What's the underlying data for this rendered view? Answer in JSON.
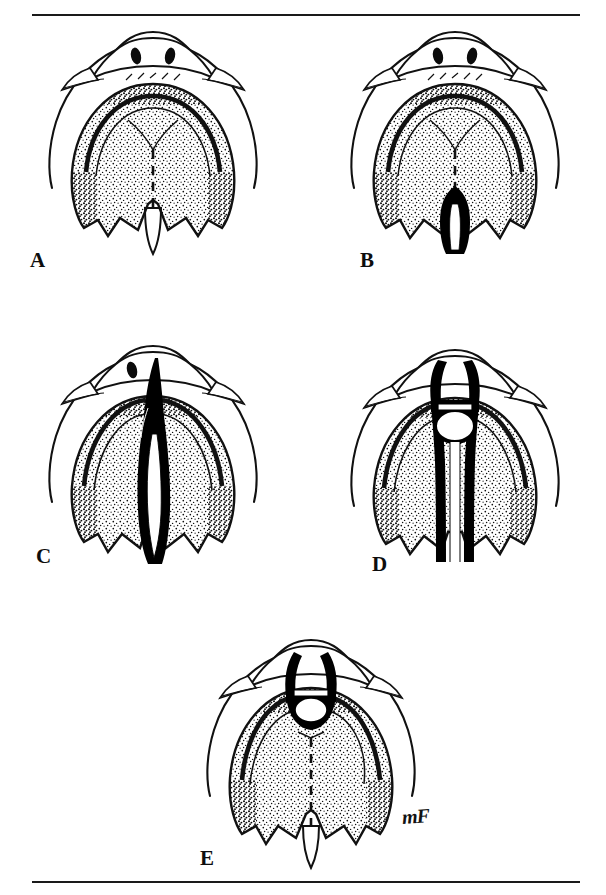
{
  "figure": {
    "medium": "pen-and-ink stipple anatomical illustration",
    "background_color": "#ffffff",
    "ink_color": "#000000",
    "rule_color": "#1a1a1a",
    "orientation": "inferior (palatal) view of the oral cavity, anterior at top",
    "signature": "mF"
  },
  "rules": {
    "top_label": "top-divider-rule",
    "bottom_label": "bottom-divider-rule"
  },
  "panels": [
    {
      "id": "A",
      "label": "A",
      "caption": "Normal palate",
      "description": "Intact hard and soft palate with midline palatine raphe shown as a dashed line and a single intact uvula.",
      "cleft_present": false,
      "cleft_extent": "none",
      "uvula": "single intact",
      "raphe_style": "dashed midline"
    },
    {
      "id": "B",
      "label": "B",
      "caption": "Cleft of the soft palate and uvula",
      "description": "Posterior cleft limited to the velum; bifid uvula with a narrow dark cleft opening, hard palate intact.",
      "cleft_present": true,
      "cleft_extent": "soft palate only",
      "uvula": "bifid",
      "raphe_style": "dashed midline anterior to cleft"
    },
    {
      "id": "C",
      "label": "C",
      "caption": "Cleft of the secondary palate",
      "description": "Cleft extends from the uvula forward through the soft and hard palate to the incisive foramen, sparing the alveolus.",
      "cleft_present": true,
      "cleft_extent": "soft and hard palate to incisive foramen",
      "uvula": "bifid",
      "raphe_style": "none"
    },
    {
      "id": "D",
      "label": "D",
      "caption": "Complete unilateral cleft lip and palate",
      "description": "Cleft runs the full length of the palate and continues through the alveolar ridge, separating a premaxillary segment anteriorly.",
      "cleft_present": true,
      "cleft_extent": "complete, palate plus alveolus",
      "uvula": "bifid",
      "raphe_style": "none"
    },
    {
      "id": "E",
      "label": "E",
      "caption": "Cleft of the primary palate (alveolus) only",
      "description": "Anterior cleft confined to the lip and alveolar ridge; hard and soft palate intact with dashed midline raphe.",
      "cleft_present": true,
      "cleft_extent": "primary palate / alveolus only",
      "uvula": "single intact",
      "raphe_style": "dashed midline"
    }
  ],
  "anatomy_legend": {
    "incisors": "paired dark incisor outlines at anterior midline",
    "alveolar_ridge": "outer horseshoe arch",
    "rugae": "transverse ridges behind incisive papilla",
    "hard_palate": "stippled anterior vault",
    "soft_palate": "stippled posterior region",
    "uvula": "midline posterior projection",
    "maxillary_tuberosity": "lateral flange on each side"
  }
}
